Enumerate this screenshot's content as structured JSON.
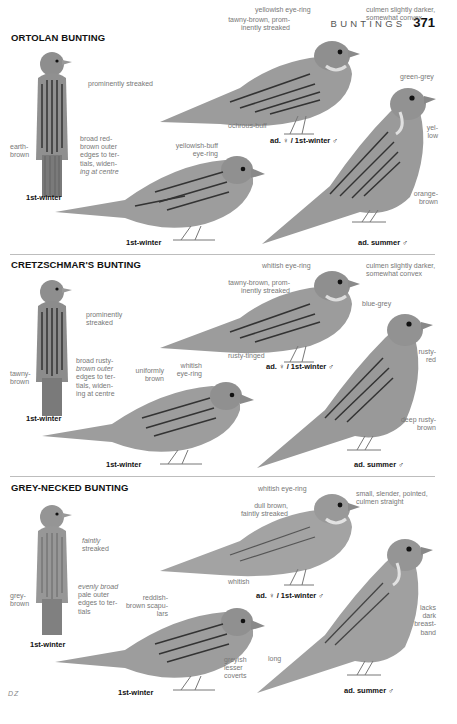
{
  "header": {
    "running_head": "BUNTINGS",
    "page_number": "371"
  },
  "colors": {
    "bird_body": "#9a9a9a",
    "bird_dark": "#3a3a3a",
    "bird_light": "#c8c8c8",
    "separator": "#bdbdbd",
    "annotation": "#777777",
    "caption": "#111111"
  },
  "species": [
    {
      "name": "ORTOLAN BUNTING",
      "annotations": {
        "back_streak": "prominently streaked",
        "back_left": "earth-brown",
        "back_tertials": [
          "broad red-",
          "brown outer",
          "edges to ter-",
          "tials, widen-",
          "ing at centre"
        ],
        "fem_eyering": "yellowish eye-ring",
        "fem_mantle": [
          "tawny-brown, prom-",
          "inently streaked"
        ],
        "fem_culmen": [
          "culmen slightly darker,",
          "somewhat convex"
        ],
        "fem_belly": "ochrous-buff",
        "male_head": "green-grey",
        "male_throat": [
          "yel-",
          "low"
        ],
        "male_belly": [
          "orange-",
          "brown"
        ],
        "juv_eyering": [
          "yellowish-buff",
          "eye-ring"
        ]
      },
      "captions": {
        "back": "1st-winter",
        "female": "ad. ♀ / 1st-winter ♂",
        "male": "ad. summer ♂",
        "juv": "1st-winter"
      }
    },
    {
      "name": "CRETZSCHMAR'S BUNTING",
      "annotations": {
        "back_streak": [
          "prominently",
          "streaked"
        ],
        "back_left": [
          "tawny-",
          "brown"
        ],
        "back_tertials": [
          "broad rusty-",
          "brown outer",
          "edges to ter-",
          "tials, widen-",
          "ing at centre"
        ],
        "fem_eyering": "whitish eye-ring",
        "fem_mantle": [
          "tawny-brown, prom-",
          "inently streaked"
        ],
        "fem_culmen": [
          "culmen slightly darker,",
          "somewhat convex"
        ],
        "fem_flank": "rusty-tinged",
        "male_head": "blue-grey",
        "male_throat": [
          "rusty-",
          "red"
        ],
        "male_belly": [
          "deep rusty-",
          "brown"
        ],
        "juv_upper": [
          "uniformly",
          "brown"
        ],
        "juv_eyering": [
          "whitish",
          "eye-ring"
        ]
      },
      "captions": {
        "back": "1st-winter",
        "female": "ad. ♀ / 1st-winter ♂",
        "male": "ad. summer ♂",
        "juv": "1st-winter"
      }
    },
    {
      "name": "GREY-NECKED BUNTING",
      "annotations": {
        "back_streak": [
          "faintly",
          "streaked"
        ],
        "back_left": [
          "grey-",
          "brown"
        ],
        "back_tertials": [
          "evenly broad",
          "pale outer",
          "edges to ter-",
          "tials"
        ],
        "fem_eyering": "whitish eye-ring",
        "fem_mantle": [
          "dull brown,",
          "faintly streaked"
        ],
        "fem_culmen": [
          "small, slender, pointed,",
          "culmen straight"
        ],
        "fem_belly": "whitish",
        "male_breast": [
          "lacks",
          "dark",
          "breast-",
          "band"
        ],
        "male_tail": "long",
        "juv_scap": [
          "reddish-",
          "brown scapu-",
          "lars"
        ],
        "juv_coverts": [
          "greyish",
          "lesser",
          "coverts"
        ]
      },
      "captions": {
        "back": "1st-winter",
        "female": "ad. ♀ / 1st-winter ♂",
        "male": "ad. summer ♂",
        "juv": "1st-winter"
      }
    }
  ],
  "credit": "DZ"
}
